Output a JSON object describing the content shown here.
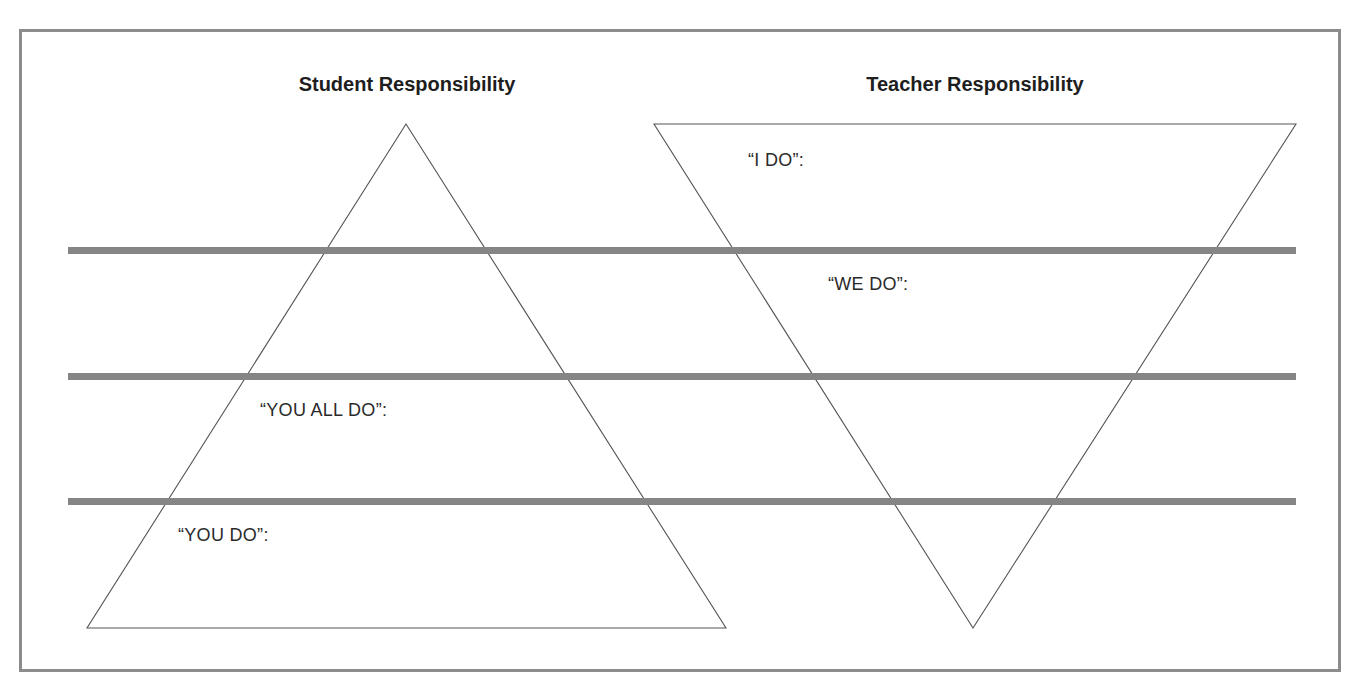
{
  "diagram": {
    "titles": {
      "student": "Student Responsibility",
      "teacher": "Teacher Responsibility"
    },
    "labels": {
      "i_do": "“I DO”:",
      "we_do": "“WE DO”:",
      "you_all_do": "“YOU ALL DO”:",
      "you_do": "“YOU DO”:"
    },
    "colors": {
      "frame": "#8c8c8c",
      "bands": "#858585",
      "triangle_stroke": "#555555",
      "text": "#1e1e1e"
    },
    "stages": [
      "I DO",
      "WE DO",
      "YOU ALL DO",
      "YOU DO"
    ]
  }
}
